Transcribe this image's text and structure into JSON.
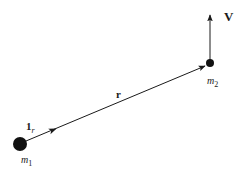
{
  "diagram": {
    "type": "two-body vector diagram",
    "nodes": [
      {
        "id": "m1",
        "label": "m",
        "subscript": "1",
        "cx": 20,
        "cy": 144,
        "r": 7
      },
      {
        "id": "m2",
        "label": "m",
        "subscript": "2",
        "cx": 210,
        "cy": 63,
        "r": 4
      }
    ],
    "vectors": [
      {
        "id": "r",
        "label": "r",
        "from": "m1",
        "to": "m2"
      },
      {
        "id": "unit_r",
        "label": "1",
        "subscript": "r",
        "from": "m1",
        "direction": "along r"
      },
      {
        "id": "V",
        "label": "V",
        "from": "m2",
        "direction": "up"
      }
    ],
    "labels": {
      "m1_main": "m",
      "m1_sub": "1",
      "m2_main": "m",
      "m2_sub": "2",
      "r": "r",
      "unit_main": "1",
      "unit_sub": "r",
      "V": "V"
    },
    "colors": {
      "ink": "#1a1a1a",
      "background": "#ffffff"
    }
  }
}
